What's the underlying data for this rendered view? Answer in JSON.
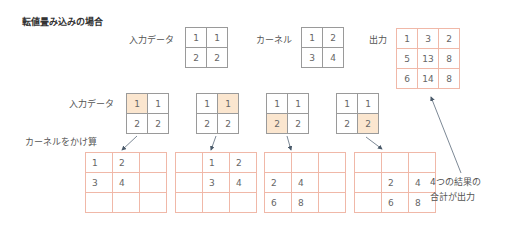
{
  "title": "転値畳み込みの場合",
  "top": {
    "input": {
      "label": "入力データ",
      "cells": [
        [
          "1",
          "1"
        ],
        [
          "2",
          "2"
        ]
      ]
    },
    "kernel": {
      "label": "カーネル",
      "cells": [
        [
          "1",
          "2"
        ],
        [
          "3",
          "4"
        ]
      ]
    },
    "output": {
      "label": "出力",
      "cells": [
        [
          "1",
          "3",
          "2"
        ],
        [
          "5",
          "13",
          "8"
        ],
        [
          "6",
          "14",
          "8"
        ]
      ]
    }
  },
  "steps": {
    "input_label": "入力データ",
    "multiply_label": "カーネルをかけ算",
    "inputs": [
      {
        "cells": [
          [
            "1",
            "1"
          ],
          [
            "2",
            "2"
          ]
        ],
        "highlight": [
          0,
          0
        ]
      },
      {
        "cells": [
          [
            "1",
            "1"
          ],
          [
            "2",
            "2"
          ]
        ],
        "highlight": [
          0,
          1
        ]
      },
      {
        "cells": [
          [
            "1",
            "1"
          ],
          [
            "2",
            "2"
          ]
        ],
        "highlight": [
          1,
          0
        ]
      },
      {
        "cells": [
          [
            "1",
            "1"
          ],
          [
            "2",
            "2"
          ]
        ],
        "highlight": [
          1,
          1
        ]
      }
    ],
    "results": [
      [
        [
          "1",
          "2",
          ""
        ],
        [
          "3",
          "4",
          ""
        ],
        [
          "",
          "",
          ""
        ]
      ],
      [
        [
          "",
          "1",
          "2"
        ],
        [
          "",
          "3",
          "4"
        ],
        [
          "",
          "",
          ""
        ]
      ],
      [
        [
          "",
          "",
          ""
        ],
        [
          "2",
          "4",
          ""
        ],
        [
          "6",
          "8",
          ""
        ]
      ],
      [
        [
          "",
          "",
          ""
        ],
        [
          "",
          "2",
          "4"
        ],
        [
          "",
          "6",
          "8"
        ]
      ]
    ]
  },
  "note": {
    "line1": "4つの結果の",
    "line2": "合計が出力"
  },
  "colors": {
    "highlight": "#fbe6cf",
    "red_border": "#f0b8a8",
    "gray_border": "#9a9a9a",
    "arrow": "#5a6a7a"
  }
}
